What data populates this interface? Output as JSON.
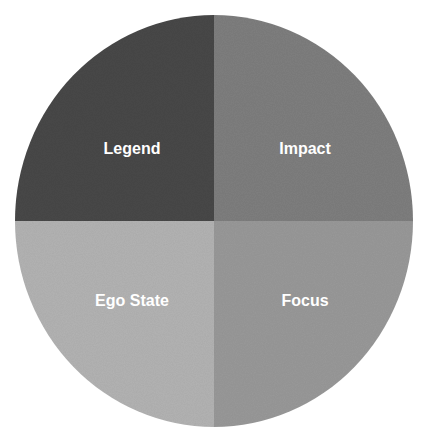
{
  "diagram": {
    "type": "quadrant-circle",
    "center": [
      214,
      221
    ],
    "radius_x": 199,
    "radius_y": 206,
    "quadrants": [
      {
        "id": "top-left",
        "label": "Legend",
        "color": "#4a4a4a",
        "label_pos": [
          132,
          148
        ]
      },
      {
        "id": "top-right",
        "label": "Impact",
        "color": "#7f7f7f",
        "label_pos": [
          305,
          148
        ]
      },
      {
        "id": "bottom-left",
        "label": "Ego State",
        "color": "#b4b4b4",
        "label_pos": [
          132,
          300
        ]
      },
      {
        "id": "bottom-right",
        "label": "Focus",
        "color": "#9a9a9a",
        "label_pos": [
          305,
          300
        ]
      }
    ]
  }
}
